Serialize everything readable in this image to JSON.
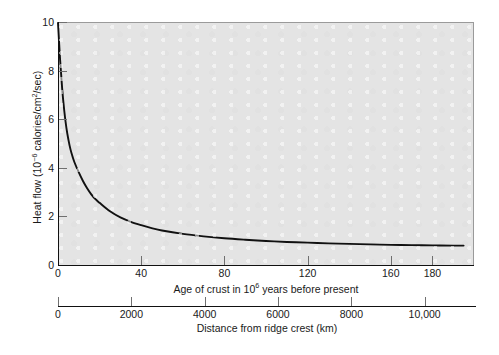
{
  "chart_data": {
    "type": "line",
    "title": "",
    "subtitle": "",
    "ylabel_plain": "Heat flow (10^-6 calories/cm^2/sec)",
    "ylabel_parts": {
      "lead": "Heat flow (10",
      "exp": "−6",
      "mid": " calories/cm",
      "exp2": "2",
      "tail": "/sec)"
    },
    "ylim": [
      0,
      10
    ],
    "yticks": [
      0,
      2,
      4,
      6,
      8,
      10
    ],
    "ytick_labels": [
      "0",
      "2",
      "4",
      "6",
      "8",
      "10"
    ],
    "xlabel_primary_parts": {
      "lead": "Age of crust in 10",
      "exp": "6",
      "tail": " years before present"
    },
    "xlabel_primary_plain": "Age of crust in 10^6 years before present",
    "xlim_age": [
      0,
      200
    ],
    "xticks_age": [
      0,
      40,
      80,
      120,
      160,
      180
    ],
    "xtick_labels_age": [
      "0",
      "40",
      "80",
      "120",
      "160",
      "180"
    ],
    "xlabel_secondary": "Distance from ridge crest (km)",
    "xlim_distance": [
      0,
      11400
    ],
    "xticks_distance": [
      0,
      2000,
      4000,
      6000,
      8000,
      10000
    ],
    "xtick_labels_distance": [
      "0",
      "2000",
      "4000",
      "6000",
      "8000",
      "10,000"
    ],
    "grid": false,
    "legend": "none",
    "series": [
      {
        "name": "Oceanic heat flow vs crustal age",
        "x_units": "million years",
        "y_units": "10^-6 calories/cm^2/sec",
        "x": [
          0,
          1,
          2,
          3,
          4,
          5,
          6,
          7,
          8,
          10,
          12,
          14,
          16,
          18,
          20,
          25,
          30,
          35,
          40,
          45,
          50,
          60,
          70,
          80,
          90,
          100,
          110,
          120,
          130,
          140,
          150,
          160,
          170,
          180,
          190,
          195
        ],
        "values": [
          10.0,
          8.5,
          7.3,
          6.4,
          5.7,
          5.2,
          4.8,
          4.5,
          4.25,
          3.85,
          3.5,
          3.2,
          2.95,
          2.75,
          2.6,
          2.25,
          2.0,
          1.82,
          1.68,
          1.56,
          1.46,
          1.32,
          1.22,
          1.14,
          1.08,
          1.03,
          0.99,
          0.96,
          0.93,
          0.91,
          0.89,
          0.87,
          0.86,
          0.85,
          0.84,
          0.84
        ]
      }
    ],
    "colors": {
      "curve": "#111111",
      "panel_background": "#e4e4e4",
      "page_background": "#ffffff",
      "axis": "#111111",
      "tick": "#6f6f6f"
    }
  }
}
